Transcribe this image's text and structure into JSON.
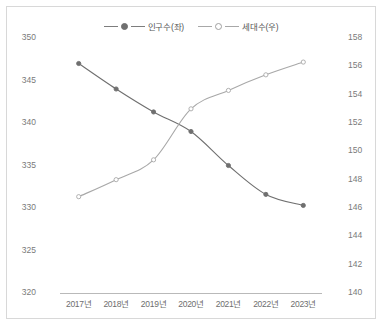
{
  "chart_data": {
    "type": "line",
    "title": "",
    "xlabel": "",
    "ylabel": "",
    "grid": false,
    "legend_position": "top-center",
    "categories": [
      "2017년",
      "2018년",
      "2019년",
      "2020년",
      "2021년",
      "2022년",
      "2023년"
    ],
    "axes": {
      "left": {
        "label": "인구수(좌)",
        "ylim": [
          320,
          350
        ],
        "ticks": [
          320,
          325,
          330,
          335,
          340,
          345,
          350
        ],
        "tick_labels": [
          "320",
          "325",
          "330",
          "335",
          "340",
          "345",
          "350"
        ]
      },
      "right": {
        "label": "세대수(우)",
        "ylim": [
          140,
          158
        ],
        "ticks": [
          140,
          142,
          144,
          146,
          148,
          150,
          152,
          154,
          156,
          158
        ],
        "tick_labels": [
          "140",
          "142",
          "144",
          "146",
          "148",
          "150",
          "152",
          "154",
          "156",
          "158"
        ]
      }
    },
    "series": [
      {
        "name": "인구수(좌)",
        "axis": "left",
        "color": "#6f6f6f",
        "marker": "filled-circle",
        "values": [
          347.0,
          344.0,
          341.3,
          339.0,
          335.0,
          331.6,
          330.3
        ]
      },
      {
        "name": "세대수(우)",
        "axis": "right",
        "color": "#a8a8a8",
        "marker": "hollow-circle",
        "values": [
          146.8,
          148.0,
          149.4,
          153.0,
          154.3,
          155.4,
          156.3
        ]
      }
    ]
  },
  "legend": {
    "items": [
      {
        "label": "인구수(좌)",
        "marker": "filled-circle",
        "color": "#6f6f6f"
      },
      {
        "label": "세대수(우)",
        "marker": "hollow-circle",
        "color": "#a8a8a8"
      }
    ]
  },
  "colors": {
    "series_left": "#6f6f6f",
    "series_right": "#a8a8a8",
    "axis": "#b9b9b9",
    "tick_text": "#7a7a7a",
    "border": "#d8d8d8",
    "background": "#ffffff"
  }
}
